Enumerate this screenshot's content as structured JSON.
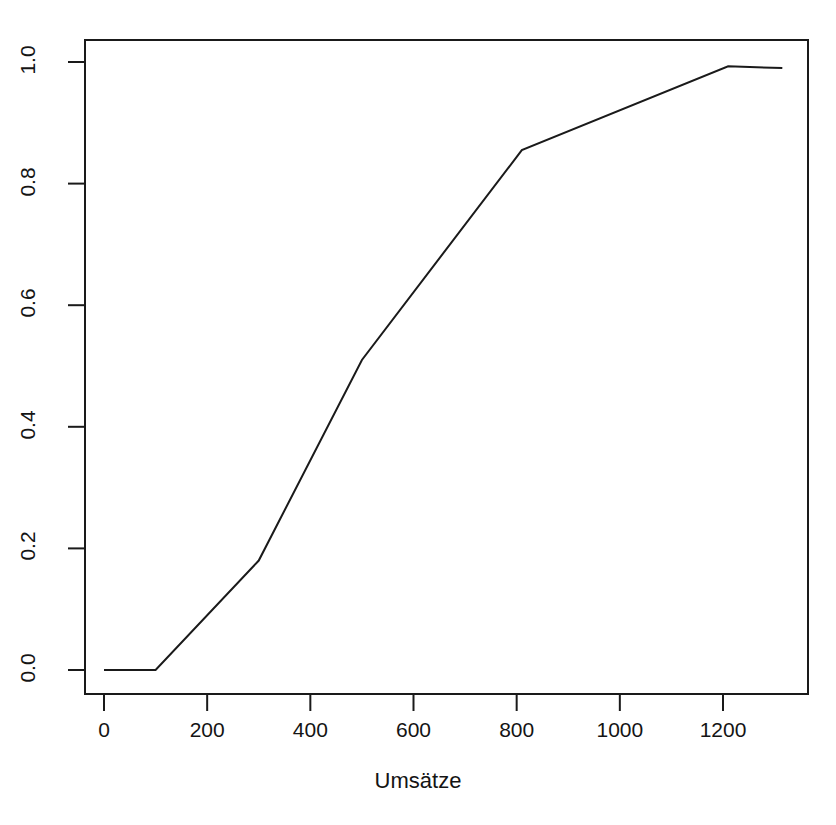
{
  "chart_data": {
    "type": "line",
    "title": "",
    "xlabel": "Umsätze",
    "ylabel": "",
    "xlim": [
      -40,
      1375
    ],
    "ylim": [
      -0.04,
      1.05
    ],
    "grid": false,
    "legend": null,
    "xticks": [
      0,
      200,
      400,
      600,
      800,
      1000,
      1200
    ],
    "xticklabels": [
      "0",
      "200",
      "400",
      "600",
      "800",
      "1000",
      "1200"
    ],
    "yticks": [
      0.0,
      0.2,
      0.4,
      0.6,
      0.8,
      1.0
    ],
    "yticklabels": [
      "0.0",
      "0.2",
      "0.4",
      "0.6",
      "0.8",
      "1.0"
    ],
    "series": [
      {
        "name": "kumulierte relative Häufigkeit",
        "x": [
          0,
          100,
          300,
          500,
          810,
          1210,
          1315
        ],
        "y": [
          0.0,
          0.0,
          0.18,
          0.51,
          0.855,
          0.993,
          0.99
        ],
        "color": "#1a1a1a",
        "linewidth": 2
      }
    ]
  },
  "axes": {
    "x_title": "Umsätze",
    "y_title": ""
  }
}
